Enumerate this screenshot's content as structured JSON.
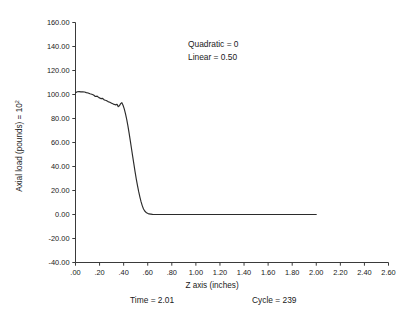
{
  "chart_data": {
    "type": "line",
    "title": "",
    "xlabel": "Z axis (inches)",
    "ylabel": "Axial load (pounds) = 10²",
    "ylabel_base": "Axial load (pounds) = 10",
    "ylabel_exponent": "2",
    "xlim": [
      0.0,
      2.6
    ],
    "ylim": [
      -40.0,
      160.0
    ],
    "grid": false,
    "legend": "none",
    "xticks": [
      0.0,
      0.2,
      0.4,
      0.6,
      0.8,
      1.0,
      1.2,
      1.4,
      1.6,
      1.8,
      2.0,
      2.2,
      2.4,
      2.6
    ],
    "xticklabels": [
      ".00",
      ".20",
      ".40",
      ".60",
      ".80",
      "1.00",
      "1.20",
      "1.40",
      "1.60",
      "1.80",
      "2.00",
      "2.20",
      "2.40",
      "2.60"
    ],
    "yticks": [
      -40.0,
      -20.0,
      0.0,
      20.0,
      40.0,
      60.0,
      80.0,
      100.0,
      120.0,
      140.0,
      160.0
    ],
    "yticklabels": [
      "-40.00",
      "-20.00",
      "0.00",
      "20.00",
      "40.00",
      "60.00",
      "80.00",
      "100.00",
      "120.00",
      "140.00",
      "160.00"
    ],
    "series": [
      {
        "name": "axial-load",
        "x": [
          0.0,
          0.015,
          0.03,
          0.045,
          0.06,
          0.075,
          0.09,
          0.105,
          0.12,
          0.135,
          0.15,
          0.165,
          0.18,
          0.195,
          0.21,
          0.225,
          0.24,
          0.255,
          0.27,
          0.285,
          0.3,
          0.315,
          0.33,
          0.345,
          0.355,
          0.365,
          0.375,
          0.385,
          0.395,
          0.405,
          0.415,
          0.425,
          0.435,
          0.445,
          0.455,
          0.465,
          0.475,
          0.485,
          0.495,
          0.505,
          0.515,
          0.525,
          0.535,
          0.545,
          0.555,
          0.565,
          0.575,
          0.59,
          0.61,
          0.64,
          0.7,
          0.8,
          1.0,
          1.2,
          1.4,
          1.6,
          1.8,
          2.0
        ],
        "y": [
          101.5,
          102.3,
          102.4,
          102.2,
          102.3,
          102.1,
          101.6,
          101.3,
          100.6,
          100.2,
          99.6,
          98.3,
          98.6,
          97.4,
          96.6,
          96.8,
          95.4,
          95.0,
          94.1,
          93.6,
          92.8,
          92.0,
          91.4,
          91.8,
          89.9,
          90.6,
          92.4,
          93.2,
          91.0,
          88.0,
          84.0,
          79.5,
          74.0,
          68.0,
          61.5,
          55.0,
          48.5,
          42.0,
          35.5,
          29.5,
          24.0,
          19.0,
          14.5,
          10.5,
          7.2,
          4.6,
          2.9,
          1.4,
          0.5,
          0.15,
          0.0,
          0.0,
          0.0,
          0.0,
          0.0,
          0.0,
          0.0,
          0.0
        ]
      }
    ],
    "annotations": [
      {
        "name": "quadratic",
        "text": "Quadratic = 0"
      },
      {
        "name": "linear",
        "text": "Linear      = 0.50"
      }
    ]
  },
  "footer": {
    "time_label": "Time = 2.01",
    "cycle_label": "Cycle = 239"
  },
  "colors": {
    "line": "#2b2b2b",
    "axis": "#3a3a3a",
    "text": "#1a1a1a",
    "background": "#ffffff"
  }
}
